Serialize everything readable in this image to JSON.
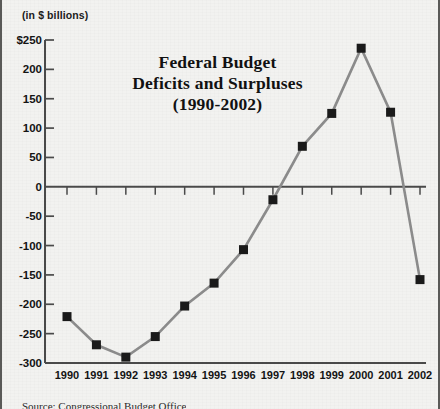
{
  "figure": {
    "units_label": "(in $ billions)",
    "source_note": "Source: Congressional Budget Office"
  },
  "chart_data": {
    "type": "line",
    "title": "Federal Budget Deficits and Surpluses (1990-2002)",
    "title_lines": [
      "Federal Budget",
      "Deficits and Surpluses",
      "(1990-2002)"
    ],
    "xlabel": "",
    "ylabel": "(in $ billions)",
    "categories": [
      "1990",
      "1991",
      "1992",
      "1993",
      "1994",
      "1995",
      "1996",
      "1997",
      "1998",
      "1999",
      "2000",
      "2001",
      "2002"
    ],
    "values": [
      -221,
      -269,
      -290,
      -255,
      -203,
      -164,
      -107,
      -22,
      69,
      125,
      236,
      127,
      -158
    ],
    "ylim": [
      -300,
      250
    ],
    "ytick_labels": [
      "$250",
      "200",
      "150",
      "100",
      "50",
      "0",
      "-50",
      "-100",
      "-150",
      "-200",
      "-250",
      "-300"
    ],
    "ytick_values": [
      250,
      200,
      150,
      100,
      50,
      0,
      -50,
      -100,
      -150,
      -200,
      -250,
      -300
    ],
    "grid": false,
    "legend": null,
    "marker": "square",
    "series_color": "#8c8c8c",
    "marker_color": "#1a1a1a",
    "axis_color": "#4a4a4a"
  }
}
